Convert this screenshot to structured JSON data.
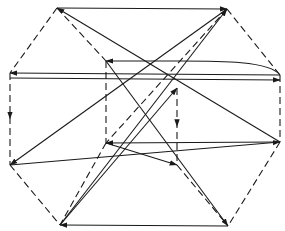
{
  "diagram": {
    "type": "directed-graph",
    "colors": {
      "line": "#1a1a1a",
      "background": "#ffffff"
    },
    "vertices": {
      "TL": [
        57,
        8
      ],
      "TR": [
        227,
        9
      ],
      "ML": [
        10,
        73
      ],
      "MR": [
        280,
        75
      ],
      "LL": [
        10,
        165
      ],
      "LR": [
        280,
        142
      ],
      "BL": [
        60,
        225
      ],
      "BR": [
        228,
        226
      ],
      "ITL": [
        106,
        61
      ],
      "ITR": [
        177,
        88
      ],
      "IBL": [
        106,
        143
      ],
      "IBR": [
        177,
        165
      ]
    },
    "dashed_edges": [
      [
        "TL",
        "ML"
      ],
      [
        "TL",
        "ITL"
      ],
      [
        "TR",
        "MR"
      ],
      [
        "TR",
        "IBL"
      ],
      [
        "ML",
        "LL"
      ],
      [
        "MR",
        "LR"
      ],
      [
        "LL",
        "BL"
      ],
      [
        "LR",
        "BR"
      ],
      [
        "ITL",
        "IBL"
      ],
      [
        "ITR",
        "IBR"
      ],
      [
        "IBL",
        "BL"
      ],
      [
        "IBR",
        "BR"
      ]
    ],
    "arrows": [
      {
        "from": "TL",
        "to": "TR"
      },
      {
        "from": "LR",
        "to": "TL"
      },
      {
        "from": "MR",
        "to": "ITL",
        "curved": true
      },
      {
        "from": "MR",
        "to": "ML"
      },
      {
        "from": "ML",
        "to": "MR"
      },
      {
        "from": "TR",
        "to": "LL"
      },
      {
        "from": "BL",
        "to": "TR"
      },
      {
        "from": "BL",
        "to": "ITR"
      },
      {
        "from": "ITL",
        "to": "BR"
      },
      {
        "from": "LL",
        "to": "LR"
      },
      {
        "from": "IBL",
        "to": "IBR"
      },
      {
        "from": "LR",
        "to": "IBL"
      },
      {
        "from": "BR",
        "to": "BL"
      },
      {
        "from": "ML",
        "to": "LL",
        "mid_arrow": true
      },
      {
        "from": "ITR",
        "to": "IBR",
        "mid_arrow": true
      }
    ]
  }
}
